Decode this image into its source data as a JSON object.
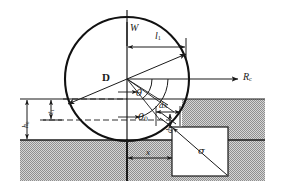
{
  "figure": {
    "type": "engineering-line-diagram",
    "width": 284,
    "height": 192,
    "background_color": "#ffffff",
    "line_color": "#1a1a1a",
    "hatch_color": "#9a9a9a",
    "hatch_background": "#d8d8d8"
  },
  "labels": {
    "load_W": "W",
    "contact_length_l": "l",
    "contact_length_l_sub": "1",
    "roll_diameter_D": "D",
    "roll_force_R": "R",
    "roll_force_R_sub": "c",
    "angle_theta": "θ",
    "angle_theta0": "θ",
    "angle_theta0_sub": "0",
    "element_dx": "dx",
    "element_dy": "dy",
    "stress_sigma": "σ",
    "coord_x": "x",
    "thickness_t": "t",
    "thickness_t_sub": "1",
    "height_h": "h",
    "height_h_sub": "0"
  },
  "geometry": {
    "circle_center_x": 127,
    "circle_center_y": 79,
    "circle_radius": 62,
    "surface_line_y": 99,
    "workpiece_top_y": 140,
    "vertical_axis_x": 127,
    "exit_line_y": 120
  },
  "elements": {
    "roll": "circle-roll-body",
    "workpiece": "hatched-workpiece-region",
    "stress_box": "stress-element-square",
    "chord": "contact-chord-line",
    "arc_theta": "angle-arc-theta",
    "arc_theta0": "angle-arc-theta0"
  }
}
